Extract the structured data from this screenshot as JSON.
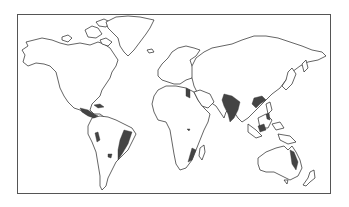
{
  "map": {
    "type": "world-outline",
    "projection": "equirectangular-like",
    "colors": {
      "background": "#ffffff",
      "frame": "#555555",
      "coastline": "#222222",
      "highlight": "#444444"
    },
    "highlighted_regions": [
      {
        "name": "Mexico / Central America"
      },
      {
        "name": "Caribbean (Cuba)"
      },
      {
        "name": "Northwestern South America"
      },
      {
        "name": "Eastern Brazil"
      },
      {
        "name": "Paraguay / central South America"
      },
      {
        "name": "Nile Delta / Egypt"
      },
      {
        "name": "Central Africa"
      },
      {
        "name": "Southeastern Africa / Mozambique"
      },
      {
        "name": "Indian subcontinent"
      },
      {
        "name": "Southern China"
      },
      {
        "name": "Philippines"
      },
      {
        "name": "Indonesia / Borneo"
      },
      {
        "name": "Eastern Australia"
      }
    ]
  }
}
